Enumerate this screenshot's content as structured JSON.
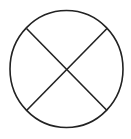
{
  "diagram": {
    "stroke_color": "#222222",
    "background_color": "#ffffff",
    "shapes": [
      "circle",
      "diagonal-line-top-left-to-bottom-right",
      "diagonal-line-top-right-to-bottom-left"
    ]
  }
}
